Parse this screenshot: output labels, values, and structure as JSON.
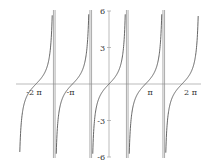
{
  "chart_data": {
    "type": "line",
    "title": "",
    "function": "tan(x)",
    "xlabel": "",
    "ylabel": "",
    "xlim": [
      -7.9,
      7.9
    ],
    "ylim": [
      -6,
      6
    ],
    "x_ticks": [
      {
        "value": -6.2832,
        "label": "-2 π"
      },
      {
        "value": -3.1416,
        "label": "-π"
      },
      {
        "value": 3.1416,
        "label": "π"
      },
      {
        "value": 6.2832,
        "label": "2 π"
      }
    ],
    "y_ticks": [
      {
        "value": 6,
        "label": "6"
      },
      {
        "value": 3,
        "label": "3"
      },
      {
        "value": -3,
        "label": "-3"
      },
      {
        "value": -6,
        "label": "-6"
      }
    ],
    "asymptotes": [
      -4.7124,
      -1.5708,
      1.5708,
      4.7124
    ],
    "grid": false,
    "legend": null,
    "colors": {
      "curve": "#555555",
      "axis": "#aaaaaa",
      "asymptote": "#888888"
    }
  }
}
